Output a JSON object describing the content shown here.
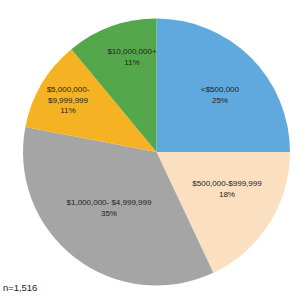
{
  "chart_data": {
    "type": "pie",
    "title": "",
    "subtitle": "",
    "xlabel": "",
    "ylabel": "",
    "legend": "none",
    "grid": false,
    "start_angle_deg": 0,
    "direction": "clockwise",
    "categories": [
      "<$500,000",
      "$500,000-$999,999",
      "$1,000,000- $4,999,999",
      "$5,000,000-$9,999,999",
      "$10,000,000+"
    ],
    "values": [
      25,
      18,
      35,
      11,
      11
    ],
    "value_labels": [
      "25%",
      "18%",
      "35%",
      "11%",
      "11%"
    ],
    "colors": [
      "#5FA9DE",
      "#FAE0C0",
      "#A5A5A5",
      "#F5B324",
      "#54A84B"
    ],
    "slices": [
      {
        "label": "<$500,000",
        "label_line1": "<$500,000",
        "label_line2": "",
        "percent": 25,
        "percent_label": "25%",
        "color": "#5FA9DE"
      },
      {
        "label": "$500,000-$999,999",
        "label_line1": "$500,000-$999,999",
        "label_line2": "",
        "percent": 18,
        "percent_label": "18%",
        "color": "#FAE0C0"
      },
      {
        "label": "$1,000,000- $4,999,999",
        "label_line1": "$1,000,000- $4,999,999",
        "label_line2": "",
        "percent": 35,
        "percent_label": "35%",
        "color": "#A5A5A5"
      },
      {
        "label": "$5,000,000-$9,999,999",
        "label_line1": "$5,000,000-",
        "label_line2": "$9,999,999",
        "percent": 11,
        "percent_label": "11%",
        "color": "#F5B324"
      },
      {
        "label": "$10,000,000+",
        "label_line1": "$10,000,000+",
        "label_line2": "",
        "percent": 11,
        "percent_label": "11%",
        "color": "#54A84B"
      }
    ],
    "annotations": [
      "n=1,516"
    ]
  },
  "footnote": {
    "sample_size": "n=1,516"
  }
}
